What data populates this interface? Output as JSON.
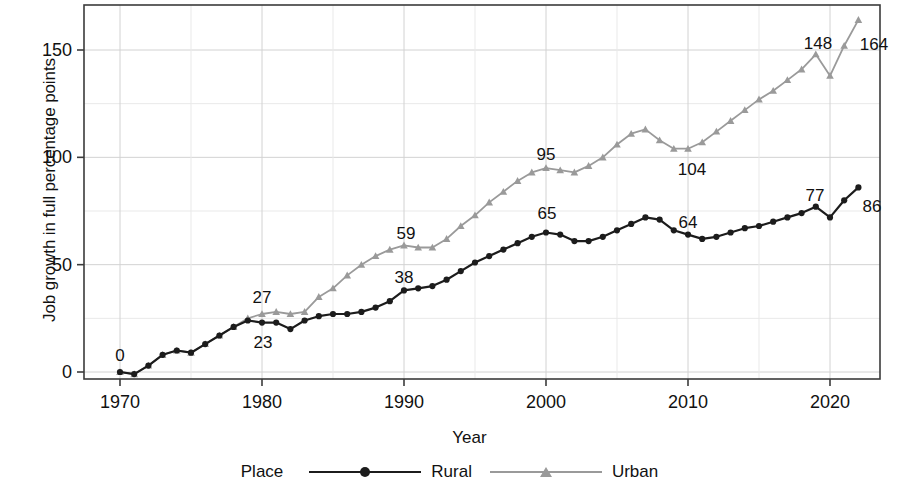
{
  "chart_data": {
    "type": "line",
    "title": "",
    "xlabel": "Year",
    "ylabel": "Job growth in full percentage points",
    "xlim": [
      1968.5,
      1970.0
    ],
    "x_ticks": [
      "1970",
      "1980",
      "1990",
      "2000",
      "2010",
      "2020"
    ],
    "y_ticks": [
      "0",
      "50",
      "100",
      "150"
    ],
    "ylim": [
      -10,
      172
    ],
    "grid": true,
    "legend_title": "Place",
    "legend_position": "bottom",
    "x": [
      1970,
      1971,
      1972,
      1973,
      1974,
      1975,
      1976,
      1977,
      1978,
      1979,
      1980,
      1981,
      1982,
      1983,
      1984,
      1985,
      1986,
      1987,
      1988,
      1989,
      1990,
      1991,
      1992,
      1993,
      1994,
      1995,
      1996,
      1997,
      1998,
      1999,
      2000,
      2001,
      2002,
      2003,
      2004,
      2005,
      2006,
      2007,
      2008,
      2009,
      2010,
      2011,
      2012,
      2013,
      2014,
      2015,
      2016,
      2017,
      2018,
      2019,
      2020,
      2021,
      2022
    ],
    "series": [
      {
        "name": "Rural",
        "color": "#1c1c1c",
        "marker": "circle",
        "values": [
          0,
          -1,
          3,
          8,
          10,
          9,
          13,
          17,
          21,
          24,
          23,
          23,
          20,
          24,
          26,
          27,
          27,
          28,
          30,
          33,
          38,
          39,
          40,
          43,
          47,
          51,
          54,
          57,
          60,
          63,
          65,
          64,
          61,
          61,
          63,
          66,
          69,
          72,
          71,
          66,
          64,
          62,
          63,
          65,
          67,
          68,
          70,
          72,
          74,
          77,
          72,
          80,
          86
        ]
      },
      {
        "name": "Urban",
        "color": "#9a9a9a",
        "marker": "triangle",
        "values": [
          0,
          -1,
          3,
          8,
          10,
          9,
          13,
          17,
          21,
          25,
          27,
          28,
          27,
          28,
          35,
          39,
          45,
          50,
          54,
          57,
          59,
          58,
          58,
          62,
          68,
          73,
          79,
          84,
          89,
          93,
          95,
          94,
          93,
          96,
          100,
          106,
          111,
          113,
          108,
          104,
          104,
          107,
          112,
          117,
          122,
          127,
          131,
          136,
          141,
          148,
          138,
          152,
          164
        ]
      }
    ],
    "point_labels": [
      {
        "series": "Rural",
        "year": 1970,
        "text": "0",
        "x": 120,
        "y": 356
      },
      {
        "series": "Rural",
        "year": 1980,
        "text": "23",
        "x": 263,
        "y": 343
      },
      {
        "series": "Urban",
        "year": 1980,
        "text": "27",
        "x": 262,
        "y": 298
      },
      {
        "series": "Rural",
        "year": 1990,
        "text": "38",
        "x": 404,
        "y": 278
      },
      {
        "series": "Urban",
        "year": 1990,
        "text": "59",
        "x": 406,
        "y": 234
      },
      {
        "series": "Rural",
        "year": 2000,
        "text": "65",
        "x": 547,
        "y": 214
      },
      {
        "series": "Urban",
        "year": 2000,
        "text": "95",
        "x": 546,
        "y": 155
      },
      {
        "series": "Rural",
        "year": 2010,
        "text": "64",
        "x": 688,
        "y": 223
      },
      {
        "series": "Urban",
        "year": 2010,
        "text": "104",
        "x": 692,
        "y": 170
      },
      {
        "series": "Rural",
        "year": 2019,
        "text": "77",
        "x": 815,
        "y": 196
      },
      {
        "series": "Urban",
        "year": 2019,
        "text": "148",
        "x": 818,
        "y": 44
      },
      {
        "series": "Rural",
        "year": 2022,
        "text": "86",
        "x": 872,
        "y": 207
      },
      {
        "series": "Urban",
        "year": 2022,
        "text": "164",
        "x": 874,
        "y": 45
      }
    ]
  },
  "axes": {
    "y_title": "Job growth in full percentage points",
    "x_title": "Year",
    "y_ticks": [
      {
        "label": "150",
        "value": 150
      },
      {
        "label": "100",
        "value": 100
      },
      {
        "label": "50",
        "value": 50
      },
      {
        "label": "0",
        "value": 0
      }
    ],
    "x_ticks": [
      {
        "label": "1970",
        "value": 1970
      },
      {
        "label": "1980",
        "value": 1980
      },
      {
        "label": "1990",
        "value": 1990
      },
      {
        "label": "2000",
        "value": 2000
      },
      {
        "label": "2010",
        "value": 2010
      },
      {
        "label": "2020",
        "value": 2020
      }
    ]
  },
  "legend": {
    "title": "Place",
    "entries": [
      {
        "label": "Rural",
        "color": "#1c1c1c",
        "marker": "circle-marker-icon"
      },
      {
        "label": "Urban",
        "color": "#9a9a9a",
        "marker": "triangle-marker-icon"
      }
    ]
  }
}
